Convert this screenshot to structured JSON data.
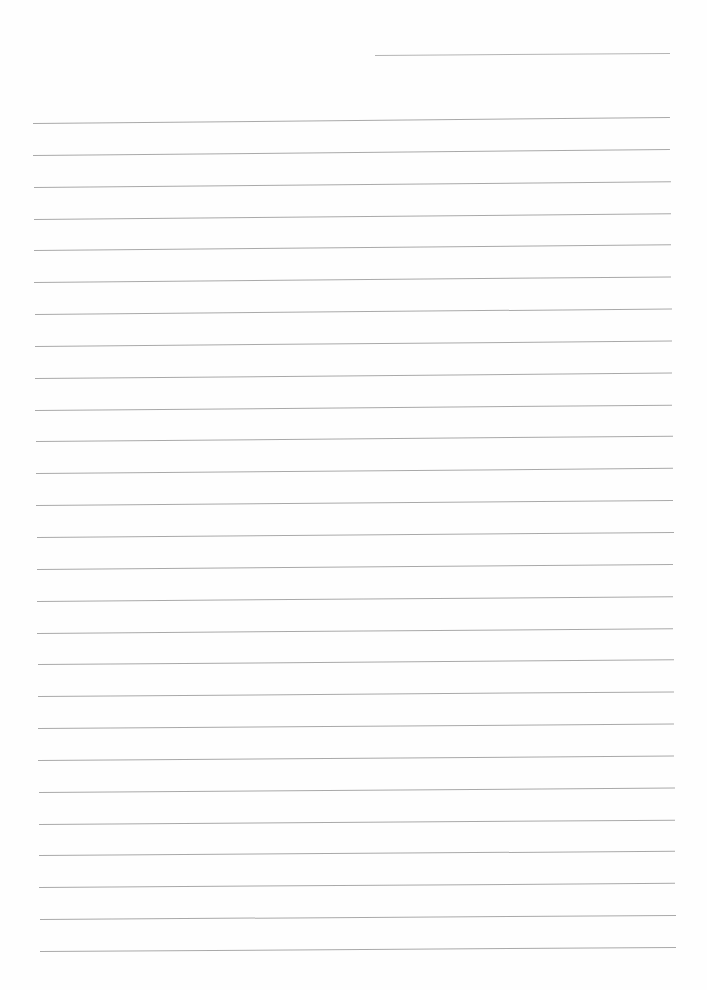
{
  "document": {
    "type": "lined-paper",
    "background_color": "#ffffff",
    "line_color": "#a9a9a9",
    "header_line": {
      "x1": 375,
      "y1": 55,
      "x2": 670,
      "y2": 53
    },
    "ruled_lines": {
      "count": 27,
      "first_left": {
        "x": 33,
        "y": 123
      },
      "first_right": {
        "x": 670,
        "y": 117
      },
      "last_left": {
        "x": 40,
        "y": 951
      },
      "last_right": {
        "x": 676,
        "y": 947
      },
      "spacing": 31.85
    },
    "text_content": ""
  }
}
